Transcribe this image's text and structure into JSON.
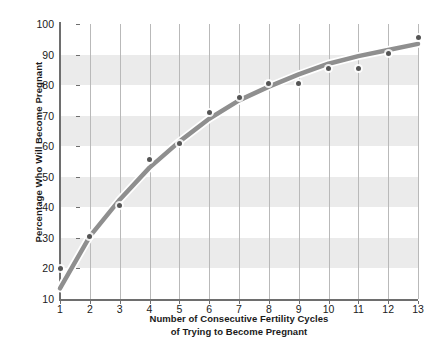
{
  "chart_data": {
    "type": "scatter",
    "title": "",
    "subtitle": "",
    "xlabel_line1": "Number of Consecutive Fertility Cycles",
    "xlabel_line2": "of Trying to Become Pregnant",
    "ylabel": "Percentage Who Will Become Pregnant",
    "x": [
      1,
      2,
      3,
      4,
      5,
      6,
      7,
      8,
      9,
      10,
      11,
      12,
      13
    ],
    "values": [
      20,
      30.5,
      40.5,
      55.5,
      61,
      71,
      76,
      80.5,
      80.5,
      85.5,
      85.5,
      90.5,
      95.5
    ],
    "series": [
      {
        "name": "Observed percentage pregnant",
        "type": "scatter",
        "values": [
          20,
          30.5,
          40.5,
          55.5,
          61,
          71,
          76,
          80.5,
          80.5,
          85.5,
          85.5,
          90.5,
          95.5
        ],
        "color": "#555555"
      },
      {
        "name": "Fitted trend curve",
        "type": "line",
        "values": [
          13.5,
          30.5,
          42.5,
          53,
          61.5,
          69,
          75,
          79.5,
          83.5,
          87,
          89.5,
          91.5,
          93.5
        ],
        "color": "#8f8f8f"
      }
    ],
    "xlim": [
      1,
      13
    ],
    "ylim": [
      10,
      100
    ],
    "xticks": [
      "1",
      "2",
      "3",
      "4",
      "5",
      "6",
      "7",
      "8",
      "9",
      "10",
      "11",
      "12",
      "13"
    ],
    "yticks": [
      "10",
      "20",
      "30",
      "40",
      "50",
      "60",
      "70",
      "80",
      "90",
      "100"
    ],
    "ytick_values": [
      10,
      20,
      30,
      40,
      50,
      60,
      70,
      80,
      90,
      100
    ],
    "grid": "vertical gridlines only, alternating horizontal gray bands",
    "bands": [
      [
        20,
        30
      ],
      [
        40,
        50
      ],
      [
        60,
        70
      ],
      [
        80,
        90
      ]
    ],
    "legend": "none",
    "colors": {
      "band": "#ebebeb",
      "gridline": "#b9b9b9",
      "axis": "#6e6e6e",
      "marker": "#555555",
      "curve": "#8f8f8f",
      "text": "#1a1a1a",
      "background": "#ffffff"
    }
  }
}
